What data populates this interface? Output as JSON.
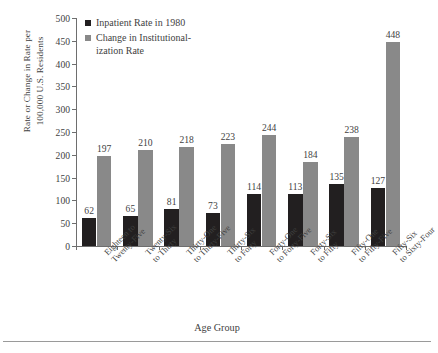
{
  "chart_data": {
    "type": "bar",
    "title": "",
    "subtitle": "",
    "xlabel": "Age Group",
    "ylabel": "Rate or Change in Rate per 100,000 U.S. Residents",
    "ylim": [
      0,
      500
    ],
    "ytick_step": 50,
    "ytick_labels": [
      "0",
      "50",
      "100",
      "150",
      "200",
      "250",
      "300",
      "350",
      "400",
      "450",
      "500"
    ],
    "grid": false,
    "legend_position": "top-left",
    "categories": [
      "Eighteen to Twenty-Five",
      "Twenty-Six to Thirty",
      "Thirty-One to Thirty-Five",
      "Thirty-Six to Forty",
      "Forty-One to Forty-Five",
      "Forty-Six to Fifty",
      "Fifty-One to Fifty-Five",
      "Fifty-Six to Sixty-Four"
    ],
    "category_lines": [
      [
        "Eighteen to",
        "Twenty-Five"
      ],
      [
        "Twenty-Six",
        "to Thirty"
      ],
      [
        "Thirty-One",
        "to Thirty-Five"
      ],
      [
        "Thirty-Six",
        "to Forty"
      ],
      [
        "Forty-One",
        "to Forty-Five"
      ],
      [
        "Forty-Six",
        "to Fifty"
      ],
      [
        "Fifty-One",
        "to Fifty-Five"
      ],
      [
        "Fifty-Six",
        "to Sixty-Four"
      ]
    ],
    "series": [
      {
        "name": "Inpatient Rate in 1980",
        "color": "#221f20",
        "values": [
          62,
          65,
          81,
          73,
          114,
          113,
          135,
          127
        ]
      },
      {
        "name": "Change in Institutionalization Rate",
        "color": "#898989",
        "legend_lines": [
          "Change in Institutional-",
          "ization Rate"
        ],
        "values": [
          197,
          210,
          218,
          223,
          244,
          184,
          238,
          448
        ]
      }
    ]
  },
  "legend": {
    "item0_label": "Inpatient Rate in 1980",
    "item1_label_line1": "Change in Institutional-",
    "item1_label_line2": "ization Rate"
  },
  "axes": {
    "y_title_line1": "Rate or Change in Rate per",
    "y_title_line2": "100,000 U.S. Residents",
    "x_title": "Age Group"
  }
}
